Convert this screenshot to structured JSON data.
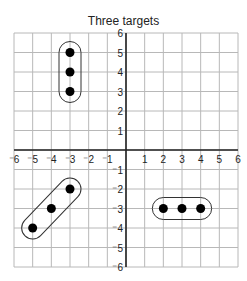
{
  "chart_data": {
    "type": "scatter",
    "title": "Three targets",
    "xlabel": "",
    "ylabel": "",
    "xlim": [
      -6,
      6
    ],
    "ylim": [
      -6,
      6
    ],
    "grid": true,
    "x_ticks": [
      -6,
      -5,
      -4,
      -3,
      -2,
      -1,
      1,
      2,
      3,
      4,
      5,
      6
    ],
    "y_ticks": [
      6,
      5,
      4,
      3,
      2,
      1,
      -1,
      -2,
      -3,
      -4,
      -5,
      -6
    ],
    "series": [
      {
        "name": "target-1",
        "points": [
          [
            -3,
            5
          ],
          [
            -3,
            4
          ],
          [
            -3,
            3
          ]
        ],
        "enclosure": "vertical-capsule"
      },
      {
        "name": "target-2",
        "points": [
          [
            -5,
            -4
          ],
          [
            -4,
            -3
          ],
          [
            -3,
            -2
          ]
        ],
        "enclosure": "diagonal-capsule"
      },
      {
        "name": "target-3",
        "points": [
          [
            2,
            -3
          ],
          [
            3,
            -3
          ],
          [
            4,
            -3
          ]
        ],
        "enclosure": "horizontal-capsule"
      }
    ],
    "colors": {
      "grid": "#b8b8b8",
      "axis": "#222222",
      "points": "#000000",
      "enclosure": "#333333"
    }
  }
}
